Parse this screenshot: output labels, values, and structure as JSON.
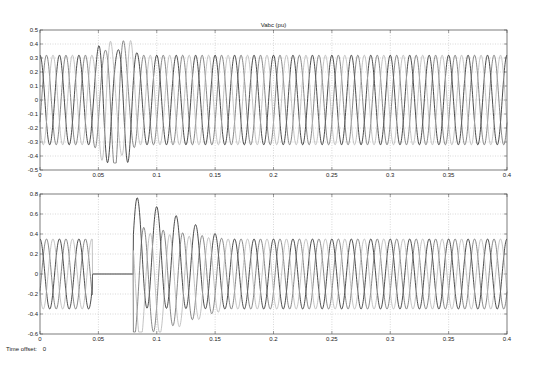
{
  "time_offset": {
    "label": "Time offset:",
    "value": "0"
  },
  "colors": {
    "phase_dark": "#1e1e1e",
    "phase_mid": "#6a6a6a",
    "phase_light": "#b4b4b4",
    "grid": "#b0b0b0",
    "axis": "#444444"
  },
  "chart_data": [
    {
      "type": "line",
      "title": "Vabc (pu)",
      "xlabel": "",
      "ylabel": "",
      "xlim": [
        0,
        0.4
      ],
      "ylim": [
        -0.5,
        0.5
      ],
      "xticks": [
        0,
        0.05,
        0.1,
        0.15,
        0.2,
        0.25,
        0.3,
        0.35,
        0.4
      ],
      "xtick_labels": [
        "0",
        "0.05",
        "0.1",
        "0.15",
        "0.2",
        "0.25",
        "0.3",
        "0.35",
        "0.4"
      ],
      "yticks": [
        -0.5,
        -0.4,
        -0.3,
        -0.2,
        -0.1,
        0,
        0.1,
        0.2,
        0.3,
        0.4,
        0.5
      ],
      "ytick_labels": [
        "-0.5",
        "-0.4",
        "-0.3",
        "-0.2",
        "-0.1",
        "0",
        "0.1",
        "0.2",
        "0.3",
        "0.4",
        "0.5"
      ],
      "grid": true,
      "frequency_hz": 60,
      "series": [
        {
          "name": "Va",
          "color": "#1e1e1e",
          "amplitude": 0.32,
          "phase_deg": 90,
          "disturbance": {
            "start": 0.045,
            "end": 0.085,
            "peak": 0.42
          }
        },
        {
          "name": "Vb",
          "color": "#6a6a6a",
          "amplitude": 0.32,
          "phase_deg": -30,
          "disturbance": {
            "start": 0.045,
            "end": 0.085,
            "peak": -0.42
          }
        },
        {
          "name": "Vc",
          "color": "#b4b4b4",
          "amplitude": 0.32,
          "phase_deg": 210,
          "disturbance": {
            "start": 0.045,
            "end": 0.085,
            "peak": 0.38
          }
        }
      ]
    },
    {
      "type": "line",
      "title": "",
      "xlabel": "",
      "ylabel": "",
      "xlim": [
        0,
        0.4
      ],
      "ylim": [
        -0.6,
        0.8
      ],
      "xticks": [
        0,
        0.05,
        0.1,
        0.15,
        0.2,
        0.25,
        0.3,
        0.35,
        0.4
      ],
      "xtick_labels": [
        "0",
        "0.05",
        "0.1",
        "0.15",
        "0.2",
        "0.25",
        "0.3",
        "0.35",
        "0.4"
      ],
      "yticks": [
        -0.6,
        -0.4,
        -0.2,
        0,
        0.2,
        0.4,
        0.6,
        0.8
      ],
      "ytick_labels": [
        "-0.6",
        "-0.4",
        "-0.2",
        "0",
        "0.2",
        "0.4",
        "0.6",
        "0.8"
      ],
      "grid": true,
      "frequency_hz": 60,
      "segments": {
        "zero_start": 0.045,
        "zero_end": 0.08,
        "transient_peak": 0.68,
        "transient_trough": -0.58,
        "decay_end": 0.16
      },
      "series": [
        {
          "name": "Ia",
          "color": "#1e1e1e",
          "amplitude": 0.35,
          "phase_deg": 90
        },
        {
          "name": "Ib",
          "color": "#6a6a6a",
          "amplitude": 0.35,
          "phase_deg": -30
        },
        {
          "name": "Ic",
          "color": "#b4b4b4",
          "amplitude": 0.35,
          "phase_deg": 210
        }
      ]
    }
  ]
}
